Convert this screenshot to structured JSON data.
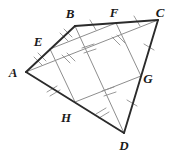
{
  "figure": {
    "width": 172,
    "height": 154,
    "background_color": "#ffffff",
    "outer_stroke_color": "#2b2b2b",
    "inner_stroke_color": "#8e8e8e",
    "label_color": "#1a1a1a",
    "points": {
      "A": {
        "label": "A",
        "x": 26,
        "y": 72,
        "label_x": 13,
        "label_y": 75
      },
      "B": {
        "label": "B",
        "x": 75,
        "y": 26,
        "label_x": 69,
        "label_y": 19
      },
      "C": {
        "label": "C",
        "x": 158,
        "y": 20,
        "label_x": 158,
        "label_y": 17
      },
      "D": {
        "label": "D",
        "x": 124,
        "y": 133,
        "label_x": 123,
        "label_y": 148
      },
      "E": {
        "label": "E",
        "x": 50,
        "y": 49,
        "label_x": 36,
        "label_y": 45
      },
      "F": {
        "label": "F",
        "x": 116,
        "y": 23,
        "label_x": 112,
        "label_y": 16
      },
      "G": {
        "label": "G",
        "x": 141,
        "y": 76,
        "label_x": 145,
        "label_y": 80
      },
      "H": {
        "label": "H",
        "x": 75,
        "y": 102,
        "label_x": 64,
        "label_y": 120
      }
    },
    "outer_edges": [
      {
        "name": "edge-AB",
        "from": "A",
        "to": "B"
      },
      {
        "name": "edge-BC",
        "from": "B",
        "to": "C"
      },
      {
        "name": "edge-CD",
        "from": "C",
        "to": "D"
      },
      {
        "name": "edge-DA",
        "from": "D",
        "to": "A"
      }
    ],
    "inner_edges": [
      {
        "name": "edge-EF",
        "from": "E",
        "to": "F"
      },
      {
        "name": "edge-FG",
        "from": "F",
        "to": "G"
      },
      {
        "name": "edge-GH",
        "from": "G",
        "to": "H"
      },
      {
        "name": "edge-HE",
        "from": "H",
        "to": "E"
      }
    ],
    "diagonals": [
      {
        "name": "diagonal-AC",
        "from": "A",
        "to": "C"
      },
      {
        "name": "diagonal-BD",
        "from": "B",
        "to": "D"
      }
    ],
    "tick_groups": [
      {
        "name": "tick-segment-BF",
        "segment": "B-F",
        "count": 1
      },
      {
        "name": "tick-segment-FC",
        "segment": "F-C",
        "count": 1
      },
      {
        "name": "tick-segment-BE",
        "segment": "B-E",
        "count": 2
      },
      {
        "name": "tick-segment-EA",
        "segment": "E-A",
        "count": 2
      },
      {
        "name": "tick-segment-AH",
        "segment": "A-H",
        "count": 2
      },
      {
        "name": "tick-segment-HD",
        "segment": "H-D",
        "count": 2
      },
      {
        "name": "tick-segment-CG",
        "segment": "C-G",
        "count": 1
      },
      {
        "name": "tick-segment-GD",
        "segment": "G-D",
        "count": 1
      }
    ]
  }
}
